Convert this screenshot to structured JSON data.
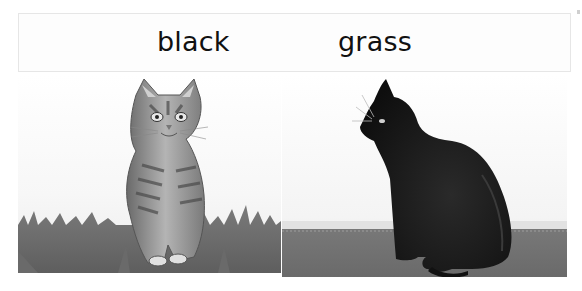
{
  "word_box": {
    "words": [
      {
        "text": "black"
      },
      {
        "text": "grass"
      }
    ]
  },
  "pictures": [
    {
      "subject": "tabby kitten sitting in grass",
      "palette": "grayscale"
    },
    {
      "subject": "black cat sitting on floor in profile",
      "palette": "grayscale"
    }
  ],
  "colors": {
    "text": "#111111",
    "box_border": "#e6e6e6",
    "grass": "#6e6e6e",
    "black_cat": "#141414"
  }
}
